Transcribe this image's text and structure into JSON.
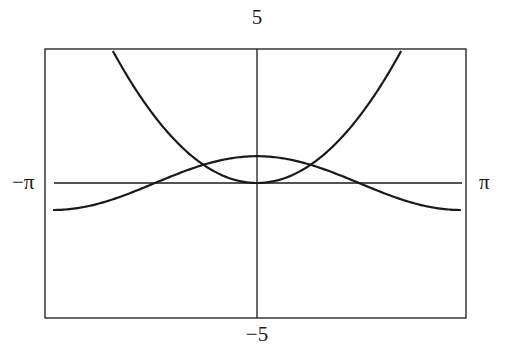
{
  "chart_data": {
    "type": "line",
    "title": "",
    "xlabel": "",
    "ylabel": "",
    "xlim": [
      -3.14159,
      3.14159
    ],
    "ylim": [
      -5,
      5
    ],
    "grid": false,
    "legend": null,
    "frame": true,
    "axes_through_origin": true,
    "tick_labels": {
      "x_min": "−π",
      "x_max": "π",
      "y_max": "5",
      "y_min": "−5"
    },
    "series": [
      {
        "name": "y = x^2",
        "expression": "x^2",
        "x": [
          -2.22,
          -2.0,
          -1.5,
          -1.0,
          -0.5,
          0.0,
          0.5,
          1.0,
          1.5,
          2.0,
          2.22
        ],
        "values": [
          4.93,
          4.0,
          2.25,
          1.0,
          0.25,
          0.0,
          0.25,
          1.0,
          2.25,
          4.0,
          4.93
        ]
      },
      {
        "name": "y = cos x",
        "expression": "cos(x)",
        "x": [
          -3.14,
          -2.5,
          -2.0,
          -1.57,
          -1.0,
          -0.5,
          0.0,
          0.5,
          1.0,
          1.57,
          2.0,
          2.5,
          3.14
        ],
        "values": [
          -1.0,
          -0.8,
          -0.42,
          0.0,
          0.54,
          0.88,
          1.0,
          0.88,
          0.54,
          0.0,
          -0.42,
          -0.8,
          -1.0
        ]
      }
    ],
    "annotations": [
      {
        "type": "intersection",
        "x": -0.824,
        "y": 0.679
      },
      {
        "type": "intersection",
        "x": 0.824,
        "y": 0.679
      }
    ]
  },
  "layout": {
    "frame": {
      "left": 45,
      "top": 49,
      "right": 466,
      "bottom": 318
    },
    "plot_x": {
      "left": 54,
      "right": 462
    },
    "origin": {
      "x": 257,
      "y": 183
    },
    "line_color": "#1a1a1a",
    "background": "#ffffff"
  }
}
